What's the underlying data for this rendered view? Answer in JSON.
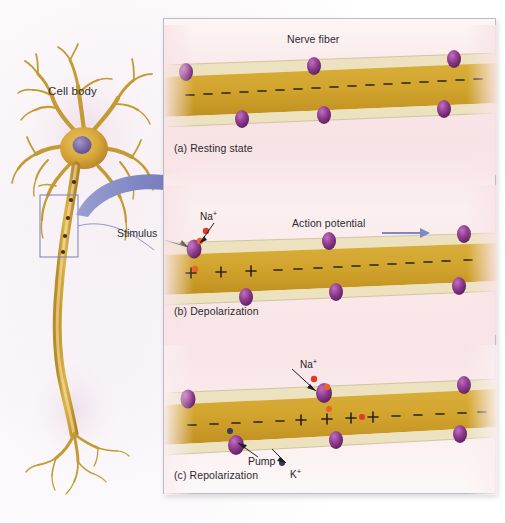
{
  "figure": {
    "cell_body_label": "Cell body",
    "stimulus_label": "Stimulus",
    "background_color": "#ffffff",
    "panel_background": "#f8e4e6",
    "panel_border_color": "#b9bcc6",
    "fiber_color": "#cfa028",
    "myelin_color": "#ece2c0",
    "channel_color": "#8e3a8e",
    "sodium_ion_color": "#e03b2a",
    "potassium_ion_color": "#3a3a50",
    "arrow_color": "#8186c4"
  },
  "neuron": {
    "soma_fill": "#d9a93c",
    "nucleus_fill": "#7b6aa8",
    "axon_fill": "#c89a30",
    "zoom_box_border": "#7a7fb5",
    "node_count": 5
  },
  "panels": [
    {
      "id": "a",
      "caption": "(a) Resting state",
      "title": "Nerve fiber",
      "title_x": 123,
      "title_y": 8,
      "has_title": true,
      "charge_inside": [
        "-",
        "-",
        "-",
        "-",
        "-",
        "-",
        "-",
        "-",
        "-",
        "-",
        "-",
        "-",
        "-",
        "-",
        "-",
        "-",
        "-",
        "-"
      ],
      "charge_note": "all negative inside at rest",
      "channels_top": [
        22,
        150,
        290
      ],
      "channels_bottom": [
        78,
        160,
        280
      ],
      "sodium_ions": [],
      "potassium_ions": [],
      "labels": []
    },
    {
      "id": "b",
      "caption": "(b) Depolarization",
      "title": "Action potential",
      "title_x": 128,
      "title_y": 32,
      "has_title": true,
      "charge_inside": [
        "+",
        "+",
        "+",
        "-",
        "-",
        "-",
        "-",
        "-",
        "-",
        "-",
        "-",
        "-",
        "-",
        "-",
        "-",
        "-",
        "-",
        "-"
      ],
      "charge_note": "first three positive, rest negative",
      "channels_top": [
        22,
        150,
        290
      ],
      "channels_bottom": [
        78,
        160,
        280
      ],
      "sodium_ions": [
        {
          "x": 30,
          "y": 46
        },
        {
          "x": 36,
          "y": 56
        },
        {
          "x": 31,
          "y": 84
        }
      ],
      "potassium_ions": [],
      "labels": [
        {
          "text": "Na",
          "sup": "+",
          "x": 36,
          "y": 24
        }
      ],
      "direction_arrow": {
        "x": 218,
        "y": 42,
        "width": 48,
        "label": "impulse direction"
      }
    },
    {
      "id": "c",
      "caption": "(c) Repolarization",
      "title": "",
      "has_title": false,
      "charge_inside": [
        "-",
        "-",
        "-",
        "-",
        "-",
        "-",
        "+",
        "+",
        "+",
        "+",
        "-",
        "-",
        "-",
        "-",
        "-",
        "-",
        "-",
        "-"
      ],
      "charge_note": "negative, then positive band in middle, then negative",
      "channels_top": [
        22,
        150,
        290
      ],
      "channels_bottom": [
        78,
        160,
        280
      ],
      "sodium_ions": [
        {
          "x": 158,
          "y": 34
        },
        {
          "x": 165,
          "y": 44
        },
        {
          "x": 160,
          "y": 72
        },
        {
          "x": 176,
          "y": 76
        }
      ],
      "potassium_ions": [
        {
          "x": 74,
          "y": 86
        },
        {
          "x": 128,
          "y": 116
        }
      ],
      "labels": [
        {
          "text": "Na",
          "sup": "+",
          "x": 136,
          "y": 12
        },
        {
          "text": "K",
          "sup": "+",
          "x": 126,
          "y": 122
        },
        {
          "text": "Pump",
          "sup": "",
          "x": 84,
          "y": 110
        }
      ]
    }
  ],
  "legend_terms": {
    "nerve_fiber": "Nerve fiber",
    "action_potential": "Action potential",
    "sodium": "Na+",
    "potassium": "K+",
    "pump": "Pump",
    "stimulus": "Stimulus",
    "cell_body": "Cell body"
  }
}
